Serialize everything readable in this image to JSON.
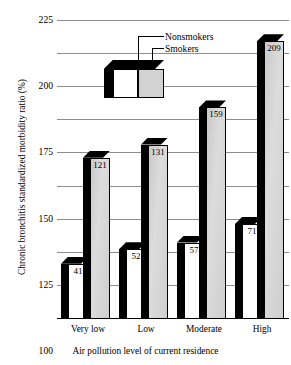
{
  "chart_data": {
    "type": "bar",
    "title": "",
    "xlabel": "Air pollution level of current residence",
    "ylabel": "Chronic bronchitis standardized morbidity ratio (%)",
    "categories": [
      "Very low",
      "Low",
      "Moderate",
      "High"
    ],
    "series": [
      {
        "name": "Nonsmokers",
        "values": [
          41,
          52,
          57,
          71
        ],
        "color": "#ffffff"
      },
      {
        "name": "Smokers",
        "values": [
          121,
          131,
          159,
          209
        ],
        "color": "#d2d2d2"
      }
    ],
    "ylim": [
      0,
      225
    ],
    "ytick_step": 25,
    "yticks": [
      "225",
      "200",
      "175",
      "150",
      "125",
      "100",
      "75",
      "50",
      "25",
      "0"
    ],
    "grid": true,
    "legend_position": "top-center"
  },
  "axis": {
    "y_title": "Chronic bronchitis standardized morbidity ratio (%)",
    "x_title": "Air pollution level of current residence"
  },
  "legend": {
    "nonsmokers_label": "Nonsmokers",
    "smokers_label": "Smokers"
  }
}
